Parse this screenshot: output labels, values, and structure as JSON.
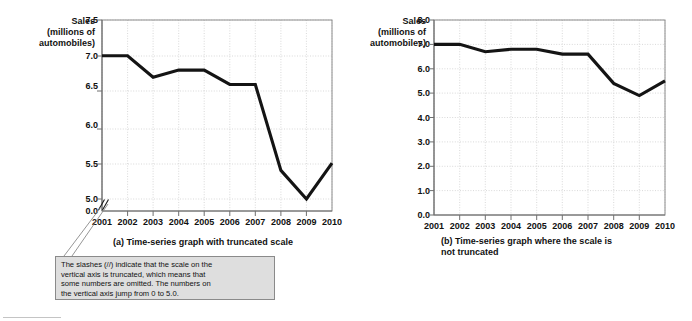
{
  "figure": {
    "y_axis_title_lines": [
      "Sales",
      "(millions of",
      "automobiles)"
    ]
  },
  "callout": {
    "text_lines": [
      "The slashes (//) indicate that the scale on the",
      "vertical axis is truncated, which means that",
      "some numbers are omitted.  The numbers on",
      "the vertical axis jump from 0 to 5.0."
    ]
  },
  "colors": {
    "line": "#141414",
    "grid": "#c9c9c9",
    "frame": "#8c8c8c",
    "callout_fill": "#dedede",
    "callout_border": "#8a8a8a"
  },
  "chart_data": [
    {
      "type": "line",
      "id": "truncated",
      "title": "(a) Time-series graph with truncated scale",
      "caption_lines": [
        "(a) Time-series graph with truncated scale"
      ],
      "xlabel": "",
      "ylabel": "Sales (millions of automobiles)",
      "categories": [
        "2001",
        "2002",
        "2003",
        "2004",
        "2005",
        "2006",
        "2007",
        "2008",
        "2009",
        "2010"
      ],
      "values": [
        7.0,
        7.0,
        6.7,
        6.8,
        6.8,
        6.6,
        6.6,
        5.4,
        4.9,
        5.5
      ],
      "ylim": [
        5.0,
        7.5
      ],
      "yticks": [
        "7.5",
        "7.0",
        "6.5",
        "6.0",
        "5.5",
        "5.0",
        "0.0"
      ],
      "ytick_values": [
        7.5,
        7.0,
        6.5,
        6.0,
        5.5,
        5.0,
        0.0
      ],
      "axis_truncated": true,
      "truncation_marker": "//",
      "grid": true,
      "legend": "none"
    },
    {
      "type": "line",
      "id": "not-truncated",
      "title": "(b) Time-series graph where the scale is not truncated",
      "caption_lines": [
        "(b) Time-series graph where the scale is",
        "not truncated"
      ],
      "xlabel": "",
      "ylabel": "Sales (millions of automobiles)",
      "categories": [
        "2001",
        "2002",
        "2003",
        "2004",
        "2005",
        "2006",
        "2007",
        "2008",
        "2009",
        "2010"
      ],
      "values": [
        7.0,
        7.0,
        6.7,
        6.8,
        6.8,
        6.6,
        6.6,
        5.4,
        4.9,
        5.5
      ],
      "ylim": [
        0.0,
        8.0
      ],
      "yticks": [
        "8.0",
        "7.0",
        "6.0",
        "5.0",
        "4.0",
        "3.0",
        "2.0",
        "1.0",
        "0.0"
      ],
      "ytick_values": [
        8.0,
        7.0,
        6.0,
        5.0,
        4.0,
        3.0,
        2.0,
        1.0,
        0.0
      ],
      "axis_truncated": false,
      "grid": true,
      "legend": "none"
    }
  ]
}
